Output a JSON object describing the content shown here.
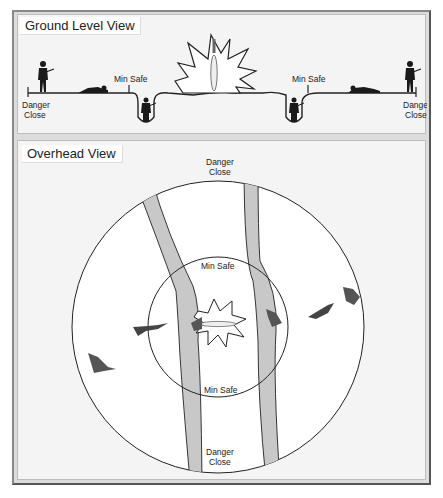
{
  "ground_view": {
    "title": "Ground Level View",
    "labels": {
      "danger_close_left": [
        "Danger",
        "Close"
      ],
      "min_safe_left": "Min Safe",
      "min_safe_right": "Min Safe",
      "danger_close_right": [
        "Danger",
        "Close"
      ]
    }
  },
  "overhead_view": {
    "title": "Overhead View",
    "labels": {
      "danger_close_top": [
        "Danger",
        "Close"
      ],
      "min_safe_top": "Min Safe",
      "min_safe_bottom": "Min Safe",
      "danger_close_bottom": [
        "Danger",
        "Close"
      ]
    }
  },
  "colors": {
    "panel_bg": "#f4f4f4",
    "frame_bg": "#dcdcdc",
    "river": "#c8c8c8",
    "line": "#222222",
    "soldier": "#1a1a1a",
    "soldier_overhead": "#555555"
  }
}
